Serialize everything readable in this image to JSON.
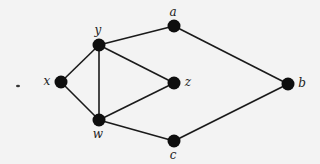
{
  "diagram": {
    "type": "undirected-graph",
    "background": "#f3f3f3",
    "node_color": "#0e0e0e",
    "edge_color": "#1a1a1a",
    "node_radius": 6.5,
    "nodes": [
      {
        "id": "x",
        "label": "x",
        "cx": 61,
        "cy": 82,
        "lx": 47,
        "ly": 81
      },
      {
        "id": "y",
        "label": "y",
        "cx": 99,
        "cy": 45,
        "lx": 98,
        "ly": 30
      },
      {
        "id": "a",
        "label": "a",
        "cx": 174,
        "cy": 26,
        "lx": 173,
        "ly": 12
      },
      {
        "id": "z",
        "label": "z",
        "cx": 174,
        "cy": 83,
        "lx": 188,
        "ly": 82
      },
      {
        "id": "b",
        "label": "b",
        "cx": 288,
        "cy": 84,
        "lx": 302,
        "ly": 83
      },
      {
        "id": "w",
        "label": "w",
        "cx": 99,
        "cy": 120,
        "lx": 98,
        "ly": 134
      },
      {
        "id": "c",
        "label": "c",
        "cx": 174,
        "cy": 141,
        "lx": 173,
        "ly": 155
      }
    ],
    "edges": [
      [
        "x",
        "y"
      ],
      [
        "x",
        "w"
      ],
      [
        "y",
        "w"
      ],
      [
        "y",
        "a"
      ],
      [
        "y",
        "z"
      ],
      [
        "w",
        "z"
      ],
      [
        "w",
        "c"
      ],
      [
        "a",
        "b"
      ],
      [
        "c",
        "b"
      ]
    ],
    "artifacts": [
      {
        "cx": 18,
        "cy": 86,
        "rx": 2,
        "ry": 1.3
      }
    ]
  }
}
